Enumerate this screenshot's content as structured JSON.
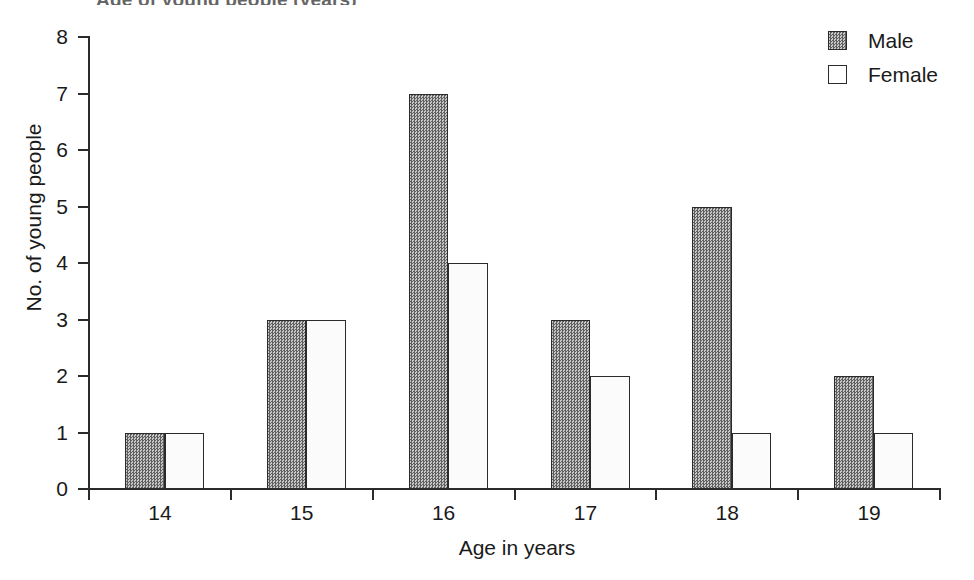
{
  "figure": {
    "clipped_title": "Age of young people (years)",
    "background_color": "#ffffff"
  },
  "legend": {
    "position": "top-right",
    "entries": [
      {
        "label": "Male",
        "swatch": "dark-dither-swatch",
        "color": "#8c8c8c"
      },
      {
        "label": "Female",
        "swatch": "white-swatch",
        "color": "#ffffff"
      }
    ]
  },
  "axes": {
    "y": {
      "title": "No. of young people",
      "ticks": [
        "0",
        "1",
        "2",
        "3",
        "4",
        "5",
        "6",
        "7",
        "8"
      ],
      "min": 0,
      "max": 8
    },
    "x": {
      "title": "Age in years",
      "ticks": [
        "14",
        "15",
        "16",
        "17",
        "18",
        "19"
      ]
    }
  },
  "chart_data": {
    "type": "bar",
    "title": "Age of young people (years)",
    "xlabel": "Age in years",
    "ylabel": "No. of young people",
    "categories": [
      "14",
      "15",
      "16",
      "17",
      "18",
      "19"
    ],
    "series": [
      {
        "name": "Male",
        "values": [
          1,
          3,
          7,
          3,
          5,
          2
        ],
        "color": "#8c8c8c"
      },
      {
        "name": "Female",
        "values": [
          1,
          3,
          4,
          2,
          1,
          1
        ],
        "color": "#ffffff"
      }
    ],
    "ylim": [
      0,
      8
    ],
    "ytick_step": 1,
    "grid": false,
    "legend_position": "top-right",
    "bar_grouping": "grouped-adjacent"
  }
}
